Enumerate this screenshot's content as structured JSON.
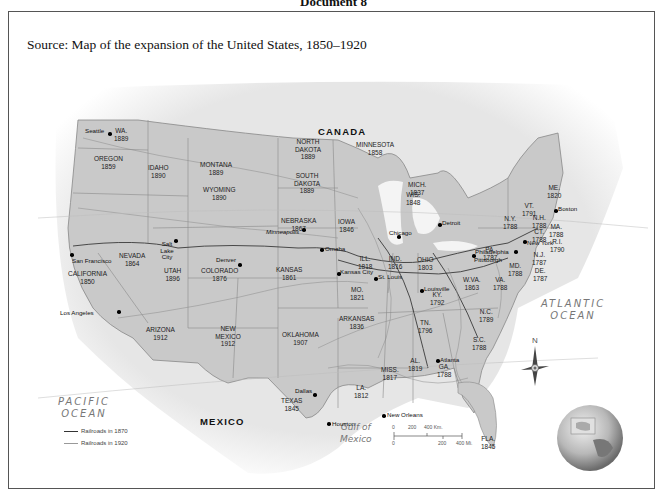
{
  "document_heading": "Document 8",
  "source_caption": "Source: Map of the expansion of the United States, 1850–1920",
  "map": {
    "countries": {
      "canada": "CANADA",
      "mexico": "MEXICO"
    },
    "water": {
      "pacific": [
        "PACIFIC",
        "OCEAN"
      ],
      "atlantic": [
        "ATLANTIC",
        "OCEAN"
      ],
      "gulf": [
        "Gulf of",
        "Mexico"
      ]
    },
    "states": [
      {
        "name": "WA.",
        "year": "1889"
      },
      {
        "name": "OREGON",
        "year": "1859"
      },
      {
        "name": "IDAHO",
        "year": "1890"
      },
      {
        "name": "MONTANA",
        "year": "1889"
      },
      {
        "name": "WYOMING",
        "year": "1890"
      },
      {
        "name": "NORTH DAKOTA",
        "year": "1889"
      },
      {
        "name": "SOUTH DAKOTA",
        "year": "1889"
      },
      {
        "name": "MINNESOTA",
        "year": "1858"
      },
      {
        "name": "NEBRASKA",
        "year": "1867"
      },
      {
        "name": "IOWA",
        "year": "1846"
      },
      {
        "name": "WIS.",
        "year": "1848"
      },
      {
        "name": "MICH.",
        "year": "1837"
      },
      {
        "name": "NEVADA",
        "year": "1864"
      },
      {
        "name": "CALIFORNIA",
        "year": "1850"
      },
      {
        "name": "UTAH",
        "year": "1896"
      },
      {
        "name": "COLORADO",
        "year": "1876"
      },
      {
        "name": "KANSAS",
        "year": "1861"
      },
      {
        "name": "ILL.",
        "year": "1818"
      },
      {
        "name": "IND.",
        "year": "1816"
      },
      {
        "name": "OHIO",
        "year": "1803"
      },
      {
        "name": "MO.",
        "year": "1821"
      },
      {
        "name": "ARIZONA",
        "year": "1912"
      },
      {
        "name": "NEW MEXICO",
        "year": "1912"
      },
      {
        "name": "OKLAHOMA",
        "year": "1907"
      },
      {
        "name": "ARKANSAS",
        "year": "1836"
      },
      {
        "name": "TEXAS",
        "year": "1845"
      },
      {
        "name": "LA.",
        "year": "1812"
      },
      {
        "name": "MISS.",
        "year": "1817"
      },
      {
        "name": "AL.",
        "year": "1819"
      },
      {
        "name": "GA.",
        "year": "1788"
      },
      {
        "name": "TN.",
        "year": "1796"
      },
      {
        "name": "KY.",
        "year": "1792"
      },
      {
        "name": "W.VA.",
        "year": "1863"
      },
      {
        "name": "VA.",
        "year": "1788"
      },
      {
        "name": "N.C.",
        "year": "1789"
      },
      {
        "name": "S.C.",
        "year": "1788"
      },
      {
        "name": "FLA.",
        "year": "1845"
      },
      {
        "name": "PA.",
        "year": "1787"
      },
      {
        "name": "N.Y.",
        "year": "1788"
      },
      {
        "name": "VT.",
        "year": "1791"
      },
      {
        "name": "N.H.",
        "year": "1788"
      },
      {
        "name": "ME.",
        "year": "1820"
      },
      {
        "name": "MA.",
        "year": "1788"
      },
      {
        "name": "CT.",
        "year": "1788"
      },
      {
        "name": "R.I.",
        "year": "1790"
      },
      {
        "name": "N.J.",
        "year": "1787"
      },
      {
        "name": "MD.",
        "year": "1788"
      },
      {
        "name": "DE.",
        "year": "1787"
      }
    ],
    "cities": [
      "Seattle",
      "San Francisco",
      "Los Angeles",
      "Salt Lake City",
      "Denver",
      "Minneapolis",
      "Omaha",
      "Kansas City",
      "Chicago",
      "St. Louis",
      "Detroit",
      "Louisville",
      "Pittsburgh",
      "Philadelphia",
      "New York",
      "Boston",
      "Atlanta",
      "Dallas",
      "Houston",
      "New Orleans"
    ],
    "legend": {
      "railroads_1870": "Railroads in 1870",
      "railroads_1920": "Railroads in 1920"
    },
    "scale": {
      "km": [
        "0",
        "200",
        "400 Km."
      ],
      "mi": [
        "0",
        "200",
        "400 Mi."
      ]
    },
    "compass": "N",
    "colors": {
      "land_states": "#c9c9c9",
      "land_other": "#ececec",
      "water": "#ffffff",
      "rail_1870": "#333333",
      "rail_1920": "#8a8a8a"
    }
  }
}
